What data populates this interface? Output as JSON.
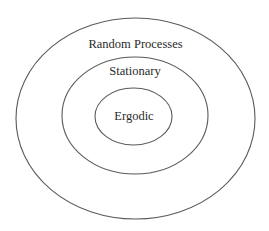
{
  "diagram": {
    "type": "nested-sets",
    "sets": [
      {
        "label": "Random Processes",
        "level": "outer"
      },
      {
        "label": "Stationary",
        "level": "middle"
      },
      {
        "label": "Ergodic",
        "level": "inner"
      }
    ],
    "stroke_color": "#5a5a5a",
    "text_color": "#2a2a2a"
  }
}
